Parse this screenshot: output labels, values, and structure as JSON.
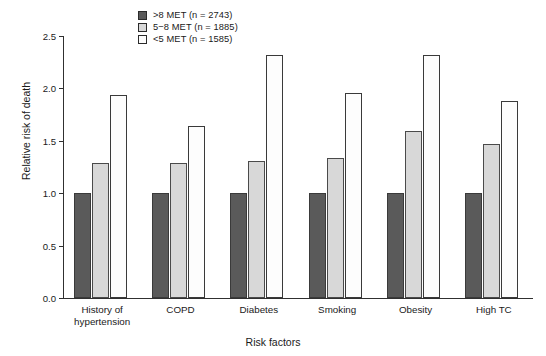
{
  "chart_data": {
    "type": "bar",
    "title": "",
    "xlabel": "Risk factors",
    "ylabel": "Relative risk of death",
    "ylim": [
      0.0,
      2.5
    ],
    "yticks": [
      "0.0",
      "0.5",
      "1.0",
      "1.5",
      "2.0",
      "2.5"
    ],
    "ytick_values": [
      0.0,
      0.5,
      1.0,
      1.5,
      2.0,
      2.5
    ],
    "grid": false,
    "legend_position": "top-center",
    "categories": [
      "History of\nhypertension",
      "COPD",
      "Diabetes",
      "Smoking",
      "Obesity",
      "High TC"
    ],
    "series": [
      {
        "name": ">8 MET (n = 2743)",
        "color": "#5a5a5a",
        "values": [
          1.0,
          1.0,
          1.0,
          1.0,
          1.0,
          1.0
        ]
      },
      {
        "name": "5−8 MET (n = 1885)",
        "color": "#d8d8d8",
        "values": [
          1.29,
          1.29,
          1.31,
          1.34,
          1.59,
          1.47
        ]
      },
      {
        "name": "<5 MET (n = 1585)",
        "color": "#fdfdfd",
        "values": [
          1.94,
          1.64,
          2.32,
          1.96,
          2.32,
          1.88
        ]
      }
    ]
  }
}
